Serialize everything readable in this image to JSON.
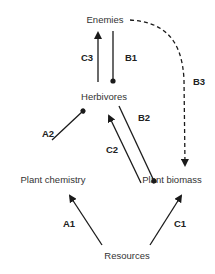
{
  "diagram": {
    "type": "interaction-web",
    "nodes": {
      "enemies": "Enemies",
      "herbivores": "Herbivores",
      "plant_chemistry": "Plant chemistry",
      "plant_biomass": "Plant biomass",
      "resources": "Resources"
    },
    "edges": {
      "c3": {
        "label": "C3",
        "from": "Herbivores",
        "to": "Enemies",
        "style": "solid",
        "head": "arrow"
      },
      "b1": {
        "label": "B1",
        "from": "Enemies",
        "to": "Herbivores",
        "style": "solid",
        "head": "dot"
      },
      "a2": {
        "label": "A2",
        "from": "Plant chemistry",
        "to": "Herbivores",
        "style": "solid",
        "head": "dot"
      },
      "c2": {
        "label": "C2",
        "from": "Plant biomass",
        "to": "Herbivores",
        "style": "solid",
        "head": "arrow"
      },
      "b2": {
        "label": "B2",
        "from": "Herbivores",
        "to": "Plant biomass",
        "style": "solid",
        "head": "dot"
      },
      "b3": {
        "label": "B3",
        "from": "Enemies",
        "to": "Plant biomass",
        "style": "dashed",
        "head": "arrow"
      },
      "a1": {
        "label": "A1",
        "from": "Resources",
        "to": "Plant chemistry",
        "style": "solid",
        "head": "arrow"
      },
      "c1": {
        "label": "C1",
        "from": "Resources",
        "to": "Plant biomass",
        "style": "solid",
        "head": "arrow"
      }
    },
    "colors": {
      "line": "#1a1a1a",
      "node_text": "#333333",
      "label_text": "#222222",
      "background": "#ffffff"
    }
  }
}
